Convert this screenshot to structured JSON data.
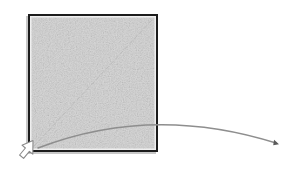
{
  "canvas": {
    "width": 302,
    "height": 174,
    "background_color": "#ffffff",
    "description": "Drag gesture illustration: a textured gray square with a dashed diagonal, a curved drag path arrow, and a mouse cursor at the lower-left corner."
  },
  "shapes": {
    "square": {
      "name": "textured-square",
      "x": 28,
      "y": 14,
      "width": 130,
      "height": 138,
      "fill_color": "#d9d9d9",
      "texture": "noise-hatch",
      "border_color": "#1c1c1c",
      "border_width": 2,
      "shadow_color": "#9a9a9a",
      "inner_highlight_color": "#efefef"
    },
    "diagonal": {
      "name": "diagonal-dashed-line",
      "x1": 34,
      "y1": 146,
      "x2": 152,
      "y2": 20,
      "stroke_color": "#bcbcbc",
      "stroke_width": 1,
      "dash_pattern": "4 3"
    },
    "drag_path": {
      "name": "curved-drag-arrow",
      "start_x": 38,
      "start_y": 148,
      "control_x": 152,
      "control_y": 104,
      "end_x": 276,
      "end_y": 143,
      "stroke_color": "#8e8e8e",
      "stroke_width": 1.4,
      "arrowhead_color": "#5a5a5a",
      "arrowhead_x": 278,
      "arrowhead_y": 145,
      "arrowhead_size": 6
    },
    "cursor": {
      "name": "mouse-cursor",
      "x": 18,
      "y": 140,
      "width": 16,
      "height": 22,
      "fill_color": "#ffffff",
      "outline_color": "#8a8a8a",
      "direction": "up-right"
    }
  }
}
